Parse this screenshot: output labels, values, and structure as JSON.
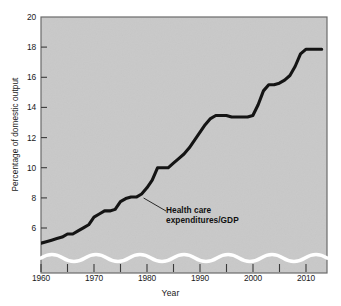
{
  "chart_data": {
    "type": "line",
    "title": "",
    "xlabel": "Year",
    "ylabel": "Percentage of domestic output",
    "xlim": [
      1960,
      2014
    ],
    "ylim": [
      4.6,
      20
    ],
    "grid": false,
    "legend": null,
    "y_axis_break": true,
    "ytick_labels": [
      "6",
      "8",
      "10",
      "12",
      "14",
      "16",
      "18",
      "20"
    ],
    "yticks": [
      6,
      8,
      10,
      12,
      14,
      16,
      18,
      20
    ],
    "xtick_labels": [
      "1960",
      "1970",
      "1980",
      "1990",
      "2000",
      "2010"
    ],
    "xticks": [
      1960,
      1970,
      1980,
      1990,
      2000,
      2010
    ],
    "xticks_minor": [
      1965,
      1975,
      1985,
      1995,
      2005
    ],
    "series": [
      {
        "name": "Health care expenditures/GDP",
        "x": [
          1960,
          1961,
          1962,
          1963,
          1964,
          1965,
          1966,
          1967,
          1968,
          1969,
          1970,
          1971,
          1972,
          1973,
          1974,
          1975,
          1976,
          1977,
          1978,
          1979,
          1980,
          1981,
          1982,
          1983,
          1984,
          1985,
          1986,
          1987,
          1988,
          1989,
          1990,
          1991,
          1992,
          1993,
          1994,
          1995,
          1996,
          1997,
          1998,
          1999,
          2000,
          2001,
          2002,
          2003,
          2004,
          2005,
          2006,
          2007,
          2008,
          2009,
          2010,
          2011,
          2012,
          2013
        ],
        "values": [
          5.3,
          5.4,
          5.5,
          5.6,
          5.7,
          5.9,
          5.9,
          6.1,
          6.3,
          6.5,
          7.0,
          7.2,
          7.4,
          7.4,
          7.5,
          8.0,
          8.2,
          8.3,
          8.3,
          8.5,
          8.9,
          9.4,
          10.2,
          10.2,
          10.2,
          10.5,
          10.8,
          11.1,
          11.5,
          12.0,
          12.5,
          13.0,
          13.4,
          13.6,
          13.6,
          13.6,
          13.5,
          13.5,
          13.5,
          13.5,
          13.6,
          14.3,
          15.2,
          15.6,
          15.6,
          15.7,
          15.9,
          16.2,
          16.8,
          17.6,
          17.9,
          17.9,
          17.9,
          17.9
        ]
      }
    ],
    "annotations": [
      {
        "name": "series-callout",
        "line1": "Health care",
        "line2": "expenditures/GDP",
        "points_to_year": 1979
      }
    ],
    "colors": {
      "plot_background": "#c9c9c9",
      "line": "#141414",
      "frame": "#5a5a5a",
      "text": "#1a1a1a",
      "axis_break": "#ffffff",
      "page_background": "#ffffff"
    }
  }
}
